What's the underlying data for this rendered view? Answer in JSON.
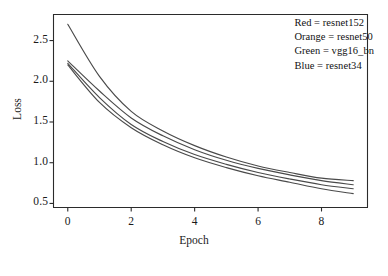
{
  "chart_data": {
    "type": "line",
    "title": "",
    "xlabel": "Epoch",
    "ylabel": "Loss",
    "xlim": [
      -0.45,
      9.45
    ],
    "ylim": [
      0.45,
      2.82
    ],
    "xticks": [
      0,
      2,
      4,
      6,
      8
    ],
    "xtick_labels": [
      "0",
      "2",
      "4",
      "6",
      "8"
    ],
    "yticks": [
      0.5,
      1.0,
      1.5,
      2.0,
      2.5
    ],
    "ytick_labels": [
      "0.5",
      "1.0",
      "1.5",
      "2.0",
      "2.5"
    ],
    "grid": false,
    "legend_position": "top-right",
    "legend_has_border": false,
    "line_color_rendered": "#4a4a4a",
    "x": [
      0,
      1,
      2,
      3,
      4,
      5,
      6,
      7,
      8,
      9
    ],
    "series": [
      {
        "name": "resnet152",
        "legend_key": "Red",
        "color": "#d62728",
        "values": [
          2.7,
          2.06,
          1.63,
          1.39,
          1.21,
          1.07,
          0.96,
          0.88,
          0.81,
          0.78
        ]
      },
      {
        "name": "resnet50",
        "legend_key": "Orange",
        "color": "#ff7f0e",
        "values": [
          2.25,
          1.88,
          1.55,
          1.33,
          1.16,
          1.03,
          0.93,
          0.85,
          0.78,
          0.73
        ]
      },
      {
        "name": "vgg16_bn",
        "legend_key": "Green",
        "color": "#2ca02c",
        "values": [
          2.22,
          1.8,
          1.47,
          1.26,
          1.1,
          0.98,
          0.88,
          0.8,
          0.73,
          0.68
        ]
      },
      {
        "name": "resnet34",
        "legend_key": "Blue",
        "color": "#1f77b4",
        "values": [
          2.2,
          1.74,
          1.43,
          1.22,
          1.06,
          0.94,
          0.84,
          0.76,
          0.68,
          0.62
        ]
      }
    ],
    "legend_entries": [
      {
        "text": "Red = resnet152"
      },
      {
        "text": "Orange = resnet50"
      },
      {
        "text": "Green = vgg16_bn"
      },
      {
        "text": "Blue = resnet34"
      }
    ]
  }
}
